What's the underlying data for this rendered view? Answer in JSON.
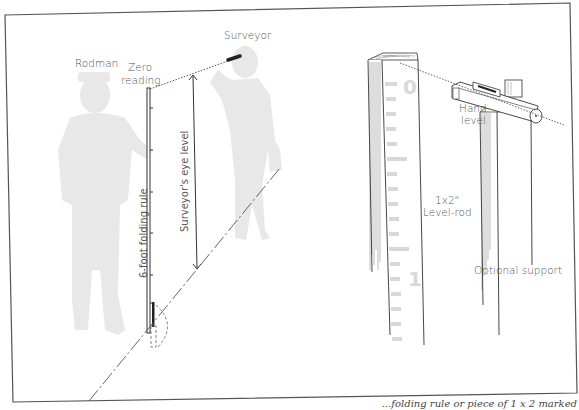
{
  "figure": {
    "left_panel": {
      "labels": {
        "surveyor": "Surveyor",
        "rodman": "Rodman",
        "zero_reading_line1": "Zero",
        "zero_reading_line2": "reading",
        "eye_level": "Surveyor's eye level",
        "folding_rule": "6-foot folding rule"
      }
    },
    "right_panel": {
      "labels": {
        "hand_level_line1": "Hand",
        "hand_level_line2": "level",
        "rod_line1": "1x2\"",
        "rod_line2": "Level-rod",
        "optional_support": "Optional support"
      },
      "rod_numerals": [
        "0",
        "1"
      ]
    },
    "caption": "...folding rule or piece of 1 x 2 marked"
  },
  "colors": {
    "frame": "#555555",
    "silhouette": "#e6e6e6",
    "line": "#333333",
    "label": "#555555"
  }
}
